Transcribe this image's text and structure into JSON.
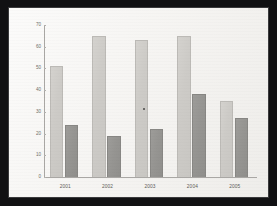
{
  "chart_data": {
    "type": "bar",
    "title": "",
    "subtitle": "",
    "xlabel": "",
    "ylabel": "",
    "categories": [
      "2001",
      "2002",
      "2003",
      "2004",
      "2005"
    ],
    "series": [
      {
        "name": "Series 1",
        "color": "#cdcbc7",
        "values": [
          51,
          65,
          63,
          65,
          35
        ]
      },
      {
        "name": "Series 2",
        "color": "#969592",
        "values": [
          24,
          19,
          22,
          38,
          27
        ]
      }
    ],
    "ylim": [
      0,
      70
    ],
    "yticks": [
      0,
      10,
      20,
      30,
      40,
      50,
      60,
      70
    ],
    "ytick_labels": [
      "0",
      "10",
      "20",
      "30",
      "40",
      "50",
      "60",
      "70"
    ],
    "grid": false,
    "legend": "none",
    "annotations": [
      {
        "name": "scan-speck",
        "category": "2003",
        "value": 32
      }
    ]
  },
  "frame": {
    "border_color": "#111113",
    "paper_color": "#f7f6f4",
    "axis_color": "#a9a7a4"
  }
}
